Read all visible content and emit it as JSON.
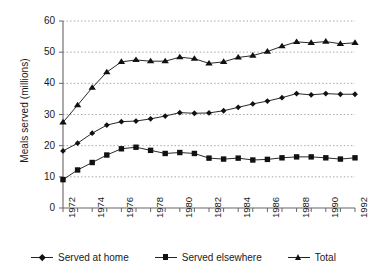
{
  "chart_data": {
    "type": "line",
    "title": "",
    "xlabel": "",
    "ylabel": "Meals served (millions)",
    "xlim": [
      1972,
      1992
    ],
    "ylim": [
      0,
      60
    ],
    "ytick_values": [
      0,
      10,
      20,
      30,
      40,
      50,
      60
    ],
    "ytick_labels": [
      "0",
      "10",
      "20",
      "30",
      "40",
      "50",
      "60"
    ],
    "xtick_values": [
      1972,
      1973,
      1974,
      1975,
      1976,
      1977,
      1978,
      1979,
      1980,
      1981,
      1982,
      1983,
      1984,
      1985,
      1986,
      1987,
      1988,
      1989,
      1990,
      1991,
      1992
    ],
    "xtick_labels": [
      "1972",
      "",
      "1974",
      "",
      "1976",
      "",
      "1978",
      "",
      "1980",
      "",
      "1982",
      "",
      "1984",
      "",
      "1986",
      "",
      "1988",
      "",
      "1990",
      "",
      "1992"
    ],
    "x": [
      1972,
      1973,
      1974,
      1975,
      1976,
      1977,
      1978,
      1979,
      1980,
      1981,
      1982,
      1983,
      1984,
      1985,
      1986,
      1987,
      1988,
      1989,
      1990,
      1991,
      1992
    ],
    "grid": "horizontal-dotted",
    "legend_position": "bottom",
    "series": [
      {
        "name": "Served at home",
        "marker": "diamond",
        "color": "#111111",
        "values": [
          18.3,
          20.8,
          24.0,
          26.6,
          27.7,
          27.9,
          28.6,
          29.5,
          30.6,
          30.4,
          30.5,
          31.2,
          32.3,
          33.4,
          34.3,
          35.4,
          36.7,
          36.3,
          36.7,
          36.5,
          36.5
        ]
      },
      {
        "name": "Served elsewhere",
        "marker": "square",
        "color": "#111111",
        "values": [
          9.1,
          12.2,
          14.6,
          17.0,
          19.0,
          19.5,
          18.5,
          17.5,
          17.8,
          17.5,
          16.0,
          15.7,
          16.0,
          15.4,
          15.6,
          16.1,
          16.4,
          16.4,
          16.1,
          15.7,
          16.1
        ]
      },
      {
        "name": "Total",
        "marker": "triangle",
        "color": "#111111",
        "values": [
          27.5,
          33.0,
          38.6,
          43.6,
          46.9,
          47.5,
          47.1,
          47.1,
          48.4,
          47.9,
          46.4,
          46.9,
          48.3,
          48.9,
          50.2,
          51.9,
          53.3,
          53.0,
          53.4,
          52.7,
          53.0
        ]
      }
    ]
  },
  "legend": {
    "items": [
      {
        "label": "Served at home",
        "marker": "diamond"
      },
      {
        "label": "Served elsewhere",
        "marker": "square"
      },
      {
        "label": "Total",
        "marker": "triangle"
      }
    ]
  }
}
